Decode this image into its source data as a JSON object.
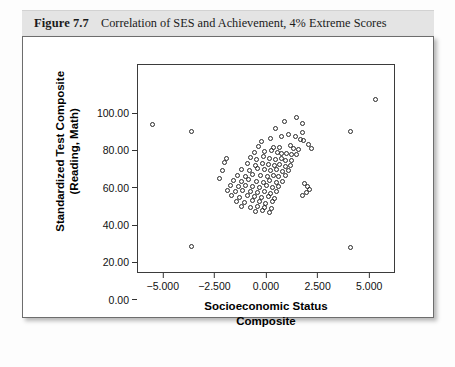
{
  "caption": {
    "figure_label": "Figure 7.7",
    "title": "Correlation of SES and Achievement, 4% Extreme Scores"
  },
  "chart_data": {
    "type": "scatter",
    "title": "Correlation of SES and Achievement, 4% Extreme Scores",
    "xlabel": "Socioeconomic Status Composite",
    "ylabel": "Standardized Test Composite (Reading, Math)",
    "xlabel_line1": "Socioeconomic Status",
    "xlabel_line2": "Composite",
    "ylabel_line1": "Standardized Test Composite",
    "ylabel_line2": "(Reading, Math)",
    "xlim": [
      -6.25,
      6.25
    ],
    "ylim": [
      -5.0,
      107.0
    ],
    "xticks": [
      -5.0,
      -2.5,
      0.0,
      2.5,
      5.0
    ],
    "xtick_labels": [
      "-5.000",
      "-2.500",
      "0.000",
      "2.500",
      "5.000"
    ],
    "yticks": [
      0.0,
      20.0,
      40.0,
      60.0,
      80.0,
      100.0
    ],
    "ytick_labels": [
      "0.00",
      "20.00",
      "40.00",
      "60.00",
      "80.00",
      "100.00"
    ],
    "grid": false,
    "legend": null,
    "marker": "open-circle",
    "marker_color": "#2a2a2a",
    "points": [
      [
        -5.55,
        75.2
      ],
      [
        -3.65,
        71.5
      ],
      [
        4.05,
        71.5
      ],
      [
        5.25,
        88.3
      ],
      [
        -3.65,
        9.6
      ],
      [
        4.05,
        9.0
      ],
      [
        0.85,
        76.5
      ],
      [
        1.45,
        79.0
      ],
      [
        1.7,
        75.5
      ],
      [
        1.72,
        71.0
      ],
      [
        0.42,
        73.2
      ],
      [
        0.7,
        68.6
      ],
      [
        1.05,
        69.5
      ],
      [
        1.38,
        68.5
      ],
      [
        1.62,
        67.0
      ],
      [
        1.78,
        66.6
      ],
      [
        0.15,
        67.6
      ],
      [
        -0.25,
        66.2
      ],
      [
        -0.4,
        63.4
      ],
      [
        0.3,
        63.0
      ],
      [
        0.62,
        62.6
      ],
      [
        1.12,
        63.8
      ],
      [
        1.3,
        62.3
      ],
      [
        1.52,
        61.7
      ],
      [
        -0.62,
        60.3
      ],
      [
        -0.1,
        60.5
      ],
      [
        0.22,
        61.0
      ],
      [
        0.52,
        60.0
      ],
      [
        0.72,
        59.4
      ],
      [
        0.95,
        59.8
      ],
      [
        1.18,
        58.9
      ],
      [
        1.42,
        59.2
      ],
      [
        -0.8,
        57.2
      ],
      [
        -0.52,
        56.4
      ],
      [
        -0.18,
        57.8
      ],
      [
        0.12,
        57.0
      ],
      [
        0.4,
        56.2
      ],
      [
        0.68,
        56.8
      ],
      [
        0.92,
        55.7
      ],
      [
        1.2,
        56.0
      ],
      [
        -0.95,
        54.0
      ],
      [
        -0.58,
        53.2
      ],
      [
        -0.22,
        54.4
      ],
      [
        0.05,
        53.6
      ],
      [
        0.35,
        53.0
      ],
      [
        0.62,
        53.8
      ],
      [
        0.88,
        52.6
      ],
      [
        1.12,
        53.4
      ],
      [
        -1.25,
        51.0
      ],
      [
        -0.85,
        50.4
      ],
      [
        -0.45,
        51.6
      ],
      [
        -0.12,
        50.8
      ],
      [
        0.18,
        50.2
      ],
      [
        0.48,
        51.0
      ],
      [
        0.75,
        50.0
      ],
      [
        1.02,
        50.6
      ],
      [
        -1.45,
        48.0
      ],
      [
        -1.05,
        47.4
      ],
      [
        -0.68,
        48.4
      ],
      [
        -0.32,
        47.8
      ],
      [
        0.0,
        47.2
      ],
      [
        0.3,
        48.0
      ],
      [
        0.58,
        47.0
      ],
      [
        0.88,
        47.6
      ],
      [
        -1.6,
        45.2
      ],
      [
        -1.22,
        44.6
      ],
      [
        -0.88,
        45.4
      ],
      [
        -0.52,
        44.8
      ],
      [
        -0.18,
        44.2
      ],
      [
        0.14,
        45.0
      ],
      [
        0.44,
        44.0
      ],
      [
        0.74,
        44.6
      ],
      [
        -1.78,
        42.4
      ],
      [
        -1.4,
        41.8
      ],
      [
        -1.05,
        42.6
      ],
      [
        -0.7,
        42.0
      ],
      [
        -0.35,
        41.4
      ],
      [
        -0.02,
        42.2
      ],
      [
        0.28,
        41.2
      ],
      [
        0.58,
        41.8
      ],
      [
        -1.92,
        39.6
      ],
      [
        -1.55,
        39.0
      ],
      [
        -1.18,
        39.8
      ],
      [
        -0.82,
        39.2
      ],
      [
        -0.48,
        38.6
      ],
      [
        -0.14,
        39.4
      ],
      [
        0.18,
        38.4
      ],
      [
        0.48,
        39.0
      ],
      [
        -1.7,
        36.8
      ],
      [
        -1.32,
        36.2
      ],
      [
        -0.95,
        37.0
      ],
      [
        -0.6,
        36.4
      ],
      [
        -0.25,
        35.8
      ],
      [
        0.08,
        36.6
      ],
      [
        0.38,
        35.6
      ],
      [
        -1.48,
        34.0
      ],
      [
        -1.1,
        33.4
      ],
      [
        -0.72,
        34.2
      ],
      [
        -0.38,
        33.6
      ],
      [
        -0.05,
        33.0
      ],
      [
        0.25,
        33.8
      ],
      [
        -1.22,
        31.2
      ],
      [
        -0.82,
        30.6
      ],
      [
        -0.45,
        31.4
      ],
      [
        -0.12,
        30.8
      ],
      [
        0.2,
        30.2
      ],
      [
        -0.55,
        28.4
      ],
      [
        -0.2,
        28.9
      ],
      [
        0.12,
        28.2
      ],
      [
        1.82,
        43.5
      ],
      [
        1.95,
        42.0
      ],
      [
        2.05,
        40.4
      ],
      [
        1.9,
        38.6
      ],
      [
        1.72,
        37.2
      ],
      [
        2.15,
        62.0
      ],
      [
        2.02,
        64.5
      ],
      [
        -2.05,
        54.8
      ],
      [
        -2.15,
        50.2
      ],
      [
        -1.95,
        57.0
      ],
      [
        -2.3,
        46.0
      ]
    ]
  }
}
